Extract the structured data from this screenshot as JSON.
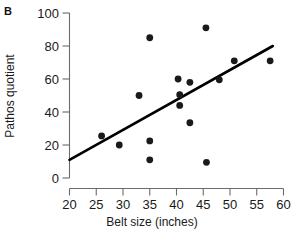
{
  "chart_data": {
    "type": "scatter",
    "title": "",
    "panel_label": "B",
    "xlabel": "Belt size (inches)",
    "ylabel": "Pathos quotient",
    "xlim": [
      20,
      60
    ],
    "ylim": [
      0,
      100
    ],
    "xticks": [
      20,
      25,
      30,
      35,
      40,
      45,
      50,
      55,
      60
    ],
    "xtick_labels": [
      "20",
      "25",
      "30",
      "35",
      "40",
      "45",
      "50",
      "55",
      "60"
    ],
    "yticks": [
      0,
      20,
      40,
      60,
      80,
      100
    ],
    "ytick_labels": [
      "0",
      "20",
      "40",
      "60",
      "80",
      "100"
    ],
    "grid": false,
    "legend": null,
    "points": [
      {
        "x": 26.0,
        "y": 25.5
      },
      {
        "x": 29.3,
        "y": 20.0
      },
      {
        "x": 33.0,
        "y": 50.0
      },
      {
        "x": 35.0,
        "y": 85.0
      },
      {
        "x": 35.0,
        "y": 22.5
      },
      {
        "x": 35.0,
        "y": 11.0
      },
      {
        "x": 40.3,
        "y": 60.0
      },
      {
        "x": 40.6,
        "y": 50.5
      },
      {
        "x": 40.6,
        "y": 44.0
      },
      {
        "x": 42.5,
        "y": 58.0
      },
      {
        "x": 42.5,
        "y": 33.5
      },
      {
        "x": 45.5,
        "y": 91.0
      },
      {
        "x": 45.6,
        "y": 9.5
      },
      {
        "x": 48.0,
        "y": 59.5
      },
      {
        "x": 50.8,
        "y": 71.0
      },
      {
        "x": 57.5,
        "y": 71.0
      }
    ],
    "trendline": {
      "x0": 20,
      "y0": 11,
      "x1": 58,
      "y1": 80
    },
    "colors": {
      "point": "#1a1a1a",
      "line": "#000000",
      "axis": "#6b6b6b",
      "text": "#1a1a1a"
    }
  }
}
